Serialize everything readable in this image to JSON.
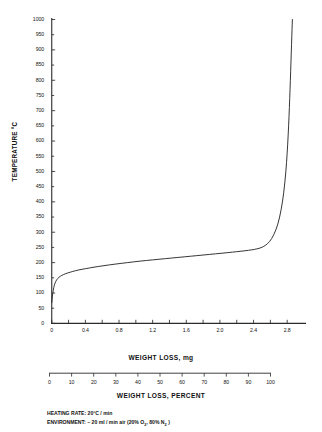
{
  "chart_data": {
    "type": "line",
    "title": "",
    "subtitle": "",
    "ylabel": "TEMPERATURE °C",
    "xlabel": "WEIGHT LOSS, mg",
    "xlabel_secondary": "WEIGHT LOSS, PERCENT",
    "ylim": [
      0,
      1000
    ],
    "xlim": [
      0,
      3.0
    ],
    "xlim_secondary": [
      0,
      100
    ],
    "grid": false,
    "legend": null,
    "y_ticks": [
      0,
      50,
      100,
      150,
      200,
      250,
      300,
      350,
      400,
      450,
      500,
      550,
      600,
      650,
      700,
      750,
      800,
      850,
      900,
      950,
      1000
    ],
    "y_tick_labels": [
      "0",
      "50",
      "100",
      "150",
      "200",
      "250",
      "300",
      "350",
      "400",
      "450",
      "500",
      "550",
      "600",
      "650",
      "700",
      "750",
      "800",
      "850",
      "900",
      "950",
      "1000"
    ],
    "x_ticks": [
      0,
      0.2,
      0.4,
      0.6,
      0.8,
      1.0,
      1.2,
      1.4,
      1.6,
      1.8,
      2.0,
      2.2,
      2.4,
      2.6,
      2.8
    ],
    "x_tick_labels_major": [
      {
        "value": 0,
        "label": "0"
      },
      {
        "value": 0.4,
        "label": "0.4"
      },
      {
        "value": 0.8,
        "label": "0.8"
      },
      {
        "value": 1.2,
        "label": "1.2"
      },
      {
        "value": 1.6,
        "label": "1.6"
      },
      {
        "value": 2.0,
        "label": "2.0"
      },
      {
        "value": 2.4,
        "label": "2.4"
      },
      {
        "value": 2.8,
        "label": "2.8"
      }
    ],
    "x_ticks_secondary": [
      0,
      10,
      20,
      30,
      40,
      50,
      60,
      70,
      80,
      90,
      100
    ],
    "x_tick_labels_secondary": [
      "0",
      "10",
      "20",
      "30",
      "40",
      "50",
      "60",
      "70",
      "80",
      "90",
      "100"
    ],
    "series": [
      {
        "name": "TGA weight loss curve",
        "color": "#2b2b2b",
        "points": [
          [
            0.0,
            68
          ],
          [
            0.008,
            90
          ],
          [
            0.018,
            110
          ],
          [
            0.03,
            126
          ],
          [
            0.048,
            139
          ],
          [
            0.07,
            148
          ],
          [
            0.1,
            155
          ],
          [
            0.14,
            161
          ],
          [
            0.19,
            166
          ],
          [
            0.25,
            171
          ],
          [
            0.32,
            176
          ],
          [
            0.4,
            180
          ],
          [
            0.5,
            185
          ],
          [
            0.62,
            190
          ],
          [
            0.75,
            195
          ],
          [
            0.9,
            200
          ],
          [
            1.05,
            205
          ],
          [
            1.2,
            209
          ],
          [
            1.35,
            213
          ],
          [
            1.5,
            217
          ],
          [
            1.65,
            221
          ],
          [
            1.8,
            225
          ],
          [
            1.95,
            229
          ],
          [
            2.1,
            233
          ],
          [
            2.2,
            236
          ],
          [
            2.3,
            239
          ],
          [
            2.38,
            242
          ],
          [
            2.44,
            245
          ],
          [
            2.49,
            249
          ],
          [
            2.54,
            256
          ],
          [
            2.59,
            268
          ],
          [
            2.64,
            290
          ],
          [
            2.69,
            325
          ],
          [
            2.73,
            375
          ],
          [
            2.76,
            430
          ],
          [
            2.785,
            500
          ],
          [
            2.8,
            560
          ],
          [
            2.812,
            620
          ],
          [
            2.822,
            680
          ],
          [
            2.83,
            740
          ],
          [
            2.838,
            800
          ],
          [
            2.845,
            860
          ],
          [
            2.852,
            920
          ],
          [
            2.858,
            970
          ],
          [
            2.862,
            1000
          ]
        ]
      }
    ],
    "annotations": [
      "HEATING RATE: 20°C / min",
      "ENVIRONMENT: ~ 20 ml / min air (20% O2, 80% N2 )"
    ]
  },
  "notes": {
    "heating_rate_label": "HEATING RATE:",
    "heating_rate_value": "20°C / min",
    "environment_label": "ENVIRONMENT:",
    "environment_value_pre": "~ 20 ml / min air (20% O",
    "environment_sub1": "2",
    "environment_value_mid": ", 80% N",
    "environment_sub2": "2",
    "environment_value_post": " )"
  },
  "colors": {
    "curve": "#2b2b2b",
    "axis": "#2b2b2b",
    "text": "#111111",
    "background": "#ffffff"
  }
}
